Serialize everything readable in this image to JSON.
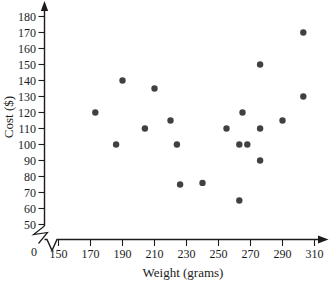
{
  "chart_data": {
    "type": "scatter",
    "xlabel": "Weight (grams)",
    "ylabel": "Cost ($)",
    "origin_label": "0",
    "x_ticks": [
      150,
      170,
      190,
      210,
      230,
      250,
      270,
      290,
      310
    ],
    "y_ticks": [
      180,
      170,
      160,
      150,
      140,
      130,
      120,
      110,
      100,
      90,
      80,
      70,
      60,
      50
    ],
    "xlim": [
      150,
      310
    ],
    "ylim": [
      50,
      180
    ],
    "grid": false,
    "legend": false,
    "axis_break_at_origin": true,
    "points": [
      [
        173,
        120
      ],
      [
        186,
        100
      ],
      [
        190,
        140
      ],
      [
        204,
        110
      ],
      [
        210,
        135
      ],
      [
        220,
        115
      ],
      [
        224,
        100
      ],
      [
        226,
        75
      ],
      [
        240,
        76
      ],
      [
        255,
        110
      ],
      [
        263,
        100
      ],
      [
        263,
        65
      ],
      [
        265,
        120
      ],
      [
        268,
        100
      ],
      [
        276,
        150
      ],
      [
        276,
        110
      ],
      [
        276,
        90
      ],
      [
        290,
        115
      ],
      [
        303,
        170
      ],
      [
        303,
        130
      ]
    ]
  },
  "colors": {
    "background": "#ffffff",
    "axis": "#1c1c1c",
    "text": "#1c1c1c",
    "dot": "#414141"
  }
}
